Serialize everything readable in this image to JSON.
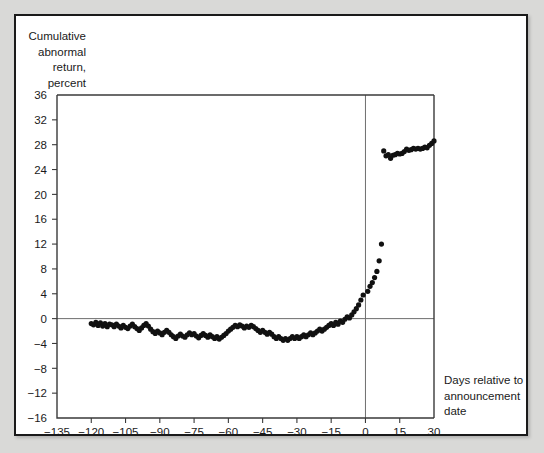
{
  "figure": {
    "background_color": "#d9d9d7",
    "panel_color": "#ffffff",
    "border_color": "#1a1a1a"
  },
  "chart_data": {
    "type": "scatter",
    "title": "",
    "ylabel_lines": [
      "Cumulative",
      "abnormal",
      "return,",
      "percent"
    ],
    "xlabel_lines": [
      "Days relative to",
      "announcement",
      "date"
    ],
    "xlabel": "Days relative to announcement date",
    "ylabel": "Cumulative abnormal return, percent",
    "xlim": [
      -135,
      30
    ],
    "ylim": [
      -16,
      36
    ],
    "xticks": [
      -135,
      -120,
      -105,
      -90,
      -75,
      -60,
      -45,
      -30,
      -15,
      0,
      15,
      30
    ],
    "xtick_labels": [
      "−135",
      "−120",
      "−105",
      "−90",
      "−75",
      "−60",
      "−45",
      "−30",
      "−15",
      "0",
      "15",
      "30"
    ],
    "yticks": [
      -16,
      -12,
      -8,
      -4,
      0,
      4,
      8,
      12,
      16,
      20,
      24,
      28,
      32,
      36
    ],
    "ytick_labels": [
      "−16",
      "−12",
      "−8",
      "−4",
      "0",
      "4",
      "8",
      "12",
      "16",
      "20",
      "24",
      "28",
      "32",
      "36"
    ],
    "grid": false,
    "legend": null,
    "annotations": [
      {
        "name": "zero-reference-line",
        "type": "hline",
        "y": 0
      },
      {
        "name": "announcement-day-line",
        "type": "vline",
        "x": 0
      }
    ],
    "marker": {
      "shape": "circle",
      "color": "#111111",
      "size": 2.6
    },
    "x": [
      -120,
      -119,
      -118,
      -117,
      -116,
      -115,
      -114,
      -113,
      -112,
      -111,
      -110,
      -109,
      -108,
      -107,
      -106,
      -105,
      -104,
      -103,
      -102,
      -101,
      -100,
      -99,
      -98,
      -97,
      -96,
      -95,
      -94,
      -93,
      -92,
      -91,
      -90,
      -89,
      -88,
      -87,
      -86,
      -85,
      -84,
      -83,
      -82,
      -81,
      -80,
      -79,
      -78,
      -77,
      -76,
      -75,
      -74,
      -73,
      -72,
      -71,
      -70,
      -69,
      -68,
      -67,
      -66,
      -65,
      -64,
      -63,
      -62,
      -61,
      -60,
      -59,
      -58,
      -57,
      -56,
      -55,
      -54,
      -53,
      -52,
      -51,
      -50,
      -49,
      -48,
      -47,
      -46,
      -45,
      -44,
      -43,
      -42,
      -41,
      -40,
      -39,
      -38,
      -37,
      -36,
      -35,
      -34,
      -33,
      -32,
      -31,
      -30,
      -29,
      -28,
      -27,
      -26,
      -25,
      -24,
      -23,
      -22,
      -21,
      -20,
      -19,
      -18,
      -17,
      -16,
      -15,
      -14,
      -13,
      -12,
      -11,
      -10,
      -9,
      -8,
      -7,
      -6,
      -5,
      -4,
      -3,
      -2,
      -1,
      1,
      2,
      3,
      4,
      5,
      6,
      7,
      8,
      9,
      10,
      11,
      12,
      13,
      14,
      15,
      16,
      17,
      18,
      19,
      20,
      21,
      22,
      23,
      24,
      25,
      26,
      27,
      28,
      29,
      30
    ],
    "y": [
      -0.8,
      -1.0,
      -0.6,
      -1.1,
      -0.7,
      -1.2,
      -0.8,
      -1.3,
      -0.9,
      -1.0,
      -1.3,
      -0.9,
      -1.2,
      -1.5,
      -1.1,
      -1.4,
      -1.6,
      -1.2,
      -0.9,
      -1.3,
      -1.6,
      -1.9,
      -1.5,
      -1.1,
      -0.8,
      -1.2,
      -1.7,
      -2.1,
      -2.4,
      -2.0,
      -2.3,
      -2.6,
      -2.2,
      -1.9,
      -2.2,
      -2.6,
      -2.9,
      -3.2,
      -2.8,
      -2.5,
      -2.8,
      -3.0,
      -2.6,
      -2.3,
      -2.6,
      -2.4,
      -2.8,
      -3.1,
      -2.7,
      -2.4,
      -2.7,
      -3.0,
      -2.6,
      -2.9,
      -3.2,
      -2.9,
      -3.3,
      -3.0,
      -2.7,
      -2.4,
      -2.0,
      -1.7,
      -1.4,
      -1.1,
      -1.3,
      -1.0,
      -1.2,
      -1.5,
      -1.2,
      -1.4,
      -1.1,
      -1.3,
      -1.6,
      -1.9,
      -2.2,
      -1.9,
      -2.2,
      -2.5,
      -2.2,
      -2.5,
      -2.9,
      -3.2,
      -2.9,
      -3.2,
      -3.5,
      -3.2,
      -3.5,
      -3.2,
      -2.9,
      -3.2,
      -2.9,
      -3.2,
      -2.9,
      -2.6,
      -2.9,
      -2.6,
      -2.3,
      -2.6,
      -2.3,
      -2.0,
      -1.7,
      -2.0,
      -1.7,
      -1.4,
      -1.1,
      -0.8,
      -1.1,
      -0.6,
      -0.9,
      -0.4,
      -0.6,
      -0.1,
      0.3,
      0.1,
      0.6,
      1.1,
      1.6,
      2.2,
      3.0,
      3.8,
      4.4,
      5.2,
      5.8,
      6.6,
      7.6,
      9.3,
      12.0,
      27.0,
      26.2,
      26.4,
      25.8,
      26.3,
      26.4,
      26.6,
      26.5,
      26.6,
      26.9,
      27.3,
      27.1,
      27.2,
      27.4,
      27.3,
      27.4,
      27.3,
      27.4,
      27.6,
      27.5,
      27.9,
      28.2,
      28.6,
      28.2,
      27.8,
      27.4,
      27.0,
      27.1,
      26.9,
      27.0,
      27.2,
      27.1,
      27.1
    ],
    "series_note": "Scatter of daily cumulative abnormal return around announcement date"
  }
}
